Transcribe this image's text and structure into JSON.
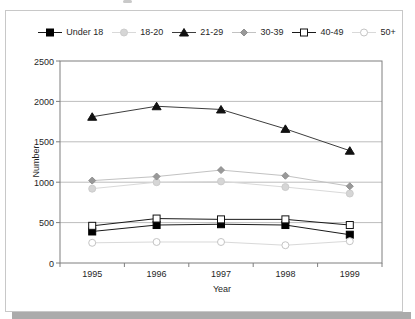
{
  "chart_data": {
    "type": "line",
    "title": "",
    "xlabel": "Year",
    "ylabel": "Number",
    "categories": [
      "1995",
      "1996",
      "1997",
      "1998",
      "1999"
    ],
    "ylim": [
      0,
      2500
    ],
    "yticks": [
      0,
      500,
      1000,
      1500,
      2000,
      2500
    ],
    "grid": "horizontal",
    "legend_position": "top",
    "series": [
      {
        "name": "Under 18",
        "marker": "square-filled",
        "marker_color": "#000000",
        "marker_stroke": "#000000",
        "line_color": "#1a1a1a",
        "values": [
          390,
          470,
          480,
          470,
          350
        ]
      },
      {
        "name": "18-20",
        "marker": "circle-filled",
        "marker_color": "#d6d6d6",
        "marker_stroke": "#cccccc",
        "line_color": "#d9d9d9",
        "values": [
          920,
          1000,
          1010,
          940,
          860
        ]
      },
      {
        "name": "21-29",
        "marker": "triangle-filled",
        "marker_color": "#111111",
        "marker_stroke": "#111111",
        "line_color": "#3d3d3d",
        "values": [
          1810,
          1940,
          1900,
          1660,
          1390
        ]
      },
      {
        "name": "30-39",
        "marker": "diamond-filled",
        "marker_color": "#999999",
        "marker_stroke": "#8f8f8f",
        "line_color": "#c2c2c2",
        "values": [
          1020,
          1070,
          1150,
          1080,
          950
        ]
      },
      {
        "name": "40-49",
        "marker": "square-open",
        "marker_color": "#ffffff",
        "marker_stroke": "#111111",
        "line_color": "#1a1a1a",
        "values": [
          460,
          550,
          540,
          540,
          470
        ]
      },
      {
        "name": "50+",
        "marker": "circle-open",
        "marker_color": "#ffffff",
        "marker_stroke": "#c4c4c4",
        "line_color": "#d9d9d9",
        "values": [
          250,
          260,
          260,
          220,
          270
        ]
      }
    ],
    "colors": {
      "plot_border": "#7f7f7f",
      "gridline": "#bdbdbd",
      "tick": "#7f7f7f",
      "text": "#1f1f1f",
      "frame_border": "#c8c8c8",
      "frame_shadow": "#ababab",
      "plot_background": "#ffffff"
    }
  }
}
